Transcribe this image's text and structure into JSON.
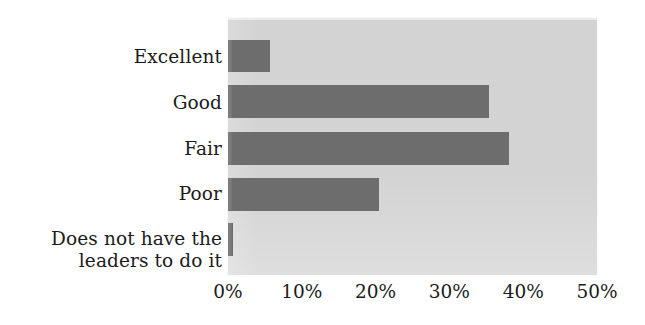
{
  "chart_data": {
    "type": "bar",
    "orientation": "horizontal",
    "title": "",
    "subtitle": "",
    "xlabel": "",
    "ylabel": "",
    "categories": [
      "Excellent",
      "Good",
      "Fair",
      "Poor",
      "Does not have the\nleaders to do it"
    ],
    "values": [
      5.7,
      35.3,
      38.1,
      20.5,
      0.7
    ],
    "value_format": "percent",
    "xlim": [
      0,
      50
    ],
    "tick_labels": [
      "0%",
      "10%",
      "20%",
      "30%",
      "40%",
      "50%"
    ],
    "tick_values": [
      0,
      10,
      20,
      30,
      40,
      50
    ],
    "grid": false,
    "legend": null,
    "annotations": [],
    "colors": {
      "bar": "#6d6d6d",
      "plot_background": "#d3d3d3",
      "figure_background": "#ffffff",
      "text": "#1b1b1b"
    }
  }
}
